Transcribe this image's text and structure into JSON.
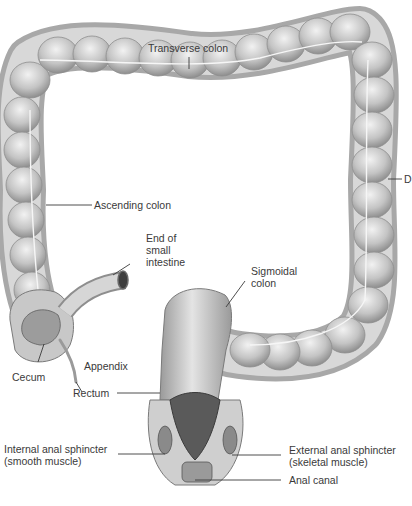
{
  "diagram": {
    "colors": {
      "tissue_light": "#e6e6e6",
      "tissue_mid": "#bdbdbd",
      "tissue_dark": "#8a8a8a",
      "leader_line": "#3a3a3a",
      "label_text": "#3a3a3a",
      "background": "#ffffff"
    },
    "labels": [
      {
        "id": "transverse",
        "text": "Transverse colon"
      },
      {
        "id": "ascending",
        "text": "Ascending colon"
      },
      {
        "id": "descending",
        "text": "D"
      },
      {
        "id": "small_intestine",
        "text": "End of\nsmall\nintestine"
      },
      {
        "id": "sigmoid",
        "text": "Sigmoidal\ncolon"
      },
      {
        "id": "cecum",
        "text": "Cecum"
      },
      {
        "id": "appendix",
        "text": "Appendix"
      },
      {
        "id": "rectum",
        "text": "Rectum"
      },
      {
        "id": "internal_sphincter",
        "text": "Internal anal sphincter\n(smooth muscle)"
      },
      {
        "id": "external_sphincter",
        "text": "External anal sphincter\n(skeletal muscle)"
      },
      {
        "id": "anal_canal",
        "text": "Anal canal"
      }
    ]
  }
}
